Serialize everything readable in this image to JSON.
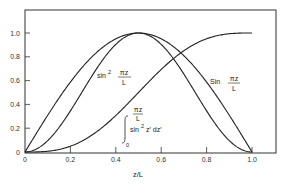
{
  "chart_data": {
    "type": "line",
    "title": "",
    "xlabel": "z/L",
    "ylabel": "",
    "xlim": [
      0,
      1.0
    ],
    "ylim": [
      0,
      1.0
    ],
    "grid": false,
    "legend": "none (inline curve annotations)",
    "x_ticks": [
      "0",
      "0.2",
      "0.4",
      "0.6",
      "0.8",
      "1.0"
    ],
    "y_ticks": [
      "0",
      "0.2",
      "0.4",
      "0.6",
      "0.8",
      "1.0"
    ],
    "x": [
      0,
      0.05,
      0.1,
      0.15,
      0.2,
      0.25,
      0.3,
      0.35,
      0.4,
      0.45,
      0.5,
      0.55,
      0.6,
      0.65,
      0.7,
      0.75,
      0.8,
      0.85,
      0.9,
      0.95,
      1.0
    ],
    "series": [
      {
        "name": "sin(πz/L)",
        "label": "Sin πz/L",
        "values": [
          0,
          0.16,
          0.31,
          0.45,
          0.59,
          0.71,
          0.81,
          0.89,
          0.95,
          0.99,
          1.0,
          0.99,
          0.95,
          0.89,
          0.81,
          0.71,
          0.59,
          0.45,
          0.31,
          0.16,
          0
        ]
      },
      {
        "name": "sin²(πz/L)",
        "label": "sin² πz/L",
        "values": [
          0,
          0.02,
          0.1,
          0.21,
          0.35,
          0.5,
          0.65,
          0.79,
          0.9,
          0.98,
          1.0,
          0.98,
          0.9,
          0.79,
          0.65,
          0.5,
          0.35,
          0.21,
          0.1,
          0.02,
          0
        ]
      },
      {
        "name": "normalized integral of sin² z′ from 0 to πz/L",
        "label": "∫₀^{πz/L} sin² z′ dz′",
        "values": [
          0,
          0.0,
          0.01,
          0.02,
          0.05,
          0.09,
          0.14,
          0.21,
          0.28,
          0.37,
          0.5,
          0.63,
          0.72,
          0.79,
          0.86,
          0.91,
          0.95,
          0.98,
          0.99,
          1.0,
          1.0
        ]
      }
    ],
    "annotations": [
      {
        "text_main": "sin",
        "sup": "2",
        "num": "πz",
        "den": "L",
        "near": [
          0.33,
          0.62
        ]
      },
      {
        "text_main": "Sin",
        "num": "πz",
        "den": "L",
        "near": [
          0.82,
          0.55
        ]
      },
      {
        "integral_upper_num": "πz",
        "integral_upper_den": "L",
        "integral_lower": "0",
        "integrand": "sin",
        "sup": "2",
        "rest": "z′ dz′",
        "near": [
          0.45,
          0.2
        ]
      }
    ]
  }
}
